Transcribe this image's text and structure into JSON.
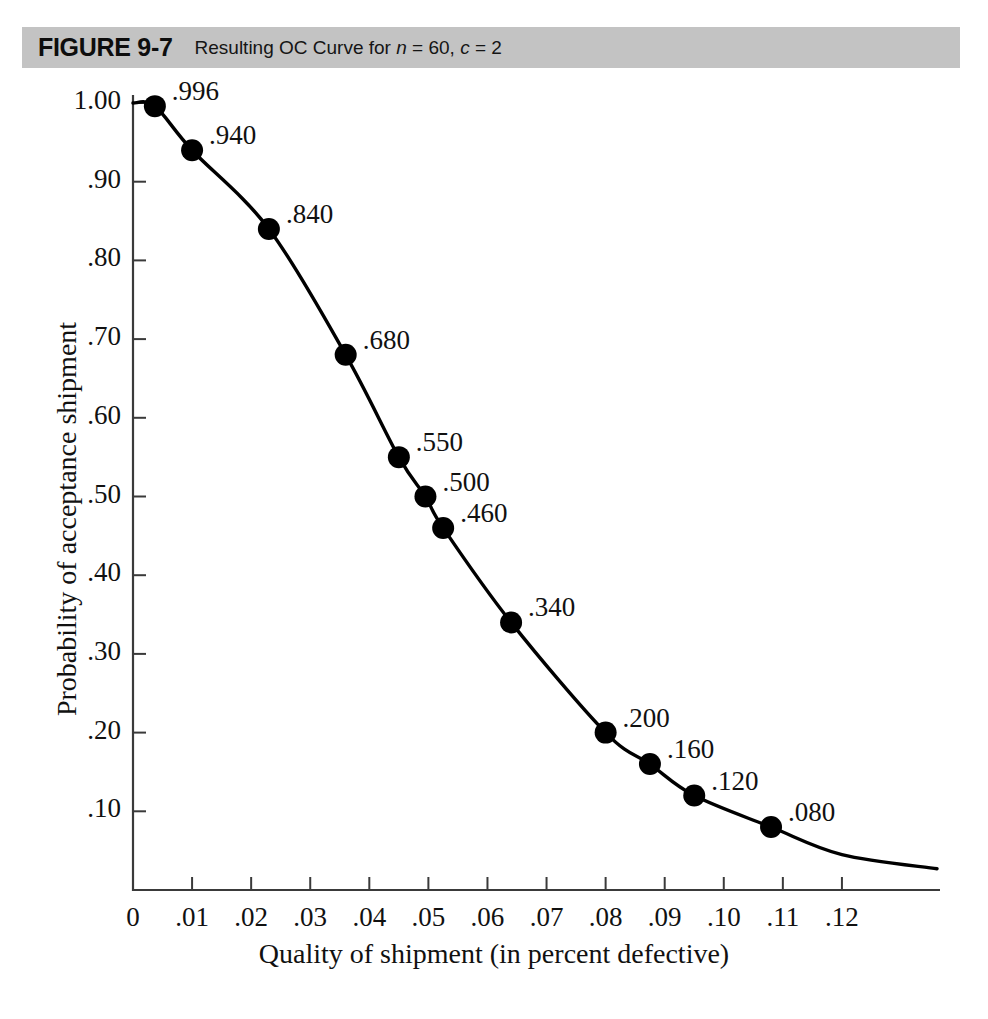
{
  "figure": {
    "number": "FIGURE 9-7",
    "caption_prefix": "Resulting OC Curve for ",
    "caption_n": "n",
    "caption_n_val": " = 60, ",
    "caption_c": "c",
    "caption_c_val": " = 2",
    "bar_color": "#c3c3c3"
  },
  "chart_data": {
    "type": "line",
    "title": "Resulting OC Curve for n = 60, c = 2",
    "xlabel": "Quality of shipment (in percent defective)",
    "ylabel": "Probability of acceptance shipment",
    "xlim": [
      0,
      0.1366
    ],
    "ylim": [
      0,
      1.0
    ],
    "grid": false,
    "legend": "none",
    "xticks": [
      0,
      0.01,
      0.02,
      0.03,
      0.04,
      0.05,
      0.06,
      0.07,
      0.08,
      0.09,
      0.1,
      0.11,
      0.12
    ],
    "xtick_labels": [
      "0",
      ".01",
      ".02",
      ".03",
      ".04",
      ".05",
      ".06",
      ".07",
      ".08",
      ".09",
      ".10",
      ".11",
      ".12"
    ],
    "yticks": [
      0.1,
      0.2,
      0.3,
      0.4,
      0.5,
      0.6,
      0.7,
      0.8,
      0.9,
      1.0
    ],
    "ytick_labels": [
      ".10",
      ".20",
      ".30",
      ".40",
      ".50",
      ".60",
      ".70",
      ".80",
      ".90",
      "1.00"
    ],
    "x": [
      0.0037,
      0.01,
      0.023,
      0.036,
      0.045,
      0.0495,
      0.0525,
      0.064,
      0.08,
      0.0875,
      0.095,
      0.108
    ],
    "y": [
      0.996,
      0.94,
      0.84,
      0.68,
      0.55,
      0.5,
      0.46,
      0.34,
      0.2,
      0.16,
      0.12,
      0.08
    ],
    "point_labels": [
      ".996",
      ".940",
      ".840",
      ".680",
      ".550",
      ".500",
      ".460",
      ".340",
      ".200",
      ".160",
      ".120",
      ".080"
    ],
    "marker": "filled-circle",
    "marker_color": "#000000",
    "line_color": "#000000"
  }
}
